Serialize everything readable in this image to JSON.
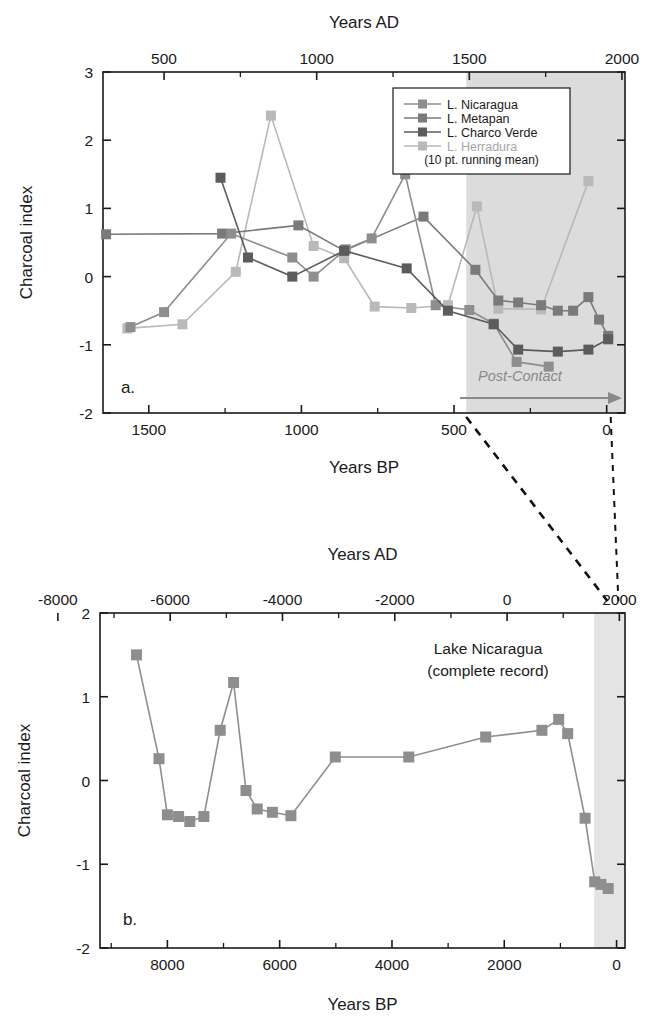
{
  "figure": {
    "background": "#ffffff",
    "shade_color": "#dcdcdc",
    "frame_color": "#1a1a1a"
  },
  "colors": {
    "nicaragua": "#8e8e8e",
    "metapan": "#7a7a7a",
    "charco_verde": "#5c5c5c",
    "herradura": "#b9b9b9",
    "post_contact": "#8a8a8a",
    "axis": "#1a1a1a"
  },
  "panel_a": {
    "letter": "a.",
    "top_axis_title": "Years AD",
    "bottom_axis_title": "Years BP",
    "y_axis_title": "Charcoal index",
    "top_ticks": [
      "500",
      "1000",
      "1500",
      "2000"
    ],
    "top_tick_values": [
      500,
      1000,
      1500,
      2000
    ],
    "bottom_ticks": [
      "1500",
      "1000",
      "500",
      "0"
    ],
    "bottom_tick_values": [
      1500,
      1000,
      500,
      0
    ],
    "y_ticks": [
      "3",
      "2",
      "1",
      "0",
      "-1",
      "-2"
    ],
    "y_tick_values": [
      3,
      2,
      1,
      0,
      -1,
      -2
    ],
    "annotation": "Post-Contact",
    "legend": {
      "note": "(10 pt. running mean)",
      "entries": [
        {
          "label": "L. Nicaragua",
          "color": "#8e8e8e"
        },
        {
          "label": "L. Metapan",
          "color": "#7a7a7a"
        },
        {
          "label": "L. Charco Verde",
          "color": "#5c5c5c"
        },
        {
          "label": "L. Herradura",
          "color": "#b9b9b9"
        }
      ]
    }
  },
  "panel_b": {
    "letter": "b.",
    "top_axis_title": "Years AD",
    "bottom_axis_title": "Years BP",
    "y_axis_title": "Charcoal index",
    "top_ticks": [
      "-8000",
      "-6000",
      "-4000",
      "-2000",
      "0",
      "2000"
    ],
    "top_tick_values": [
      -8000,
      -6000,
      -4000,
      -2000,
      0,
      2000
    ],
    "bottom_ticks": [
      "8000",
      "6000",
      "4000",
      "2000",
      "0"
    ],
    "bottom_tick_values": [
      8000,
      6000,
      4000,
      2000,
      0
    ],
    "y_ticks": [
      "2",
      "1",
      "0",
      "-1",
      "-2"
    ],
    "y_tick_values": [
      2,
      1,
      0,
      -1,
      -2
    ],
    "annotation_line1": "Lake Nicaragua",
    "annotation_line2": "(complete record)"
  },
  "chart_data": [
    {
      "type": "line",
      "panel": "a",
      "title": "",
      "xlabel": "Years BP",
      "ylabel": "Charcoal index",
      "xlim": [
        1650,
        -60
      ],
      "ylim": [
        -2,
        3
      ],
      "x_reversed": true,
      "grid": false,
      "legend_position": "top-right",
      "shaded_region": {
        "label": "Post-Contact",
        "x_from": 460,
        "x_to": -60
      },
      "series": [
        {
          "name": "L. Nicaragua",
          "color": "#8e8e8e",
          "points": [
            [
              1560,
              -0.74
            ],
            [
              1450,
              -0.52
            ],
            [
              1230,
              0.63
            ],
            [
              1030,
              0.28
            ],
            [
              960,
              0.0
            ],
            [
              855,
              0.4
            ],
            [
              770,
              0.56
            ],
            [
              660,
              1.5
            ],
            [
              560,
              -0.42
            ],
            [
              450,
              -0.49
            ],
            [
              370,
              -0.69
            ],
            [
              295,
              -1.25
            ],
            [
              190,
              -1.32
            ]
          ]
        },
        {
          "name": "L. Metapan",
          "color": "#7a7a7a",
          "points": [
            [
              1640,
              0.62
            ],
            [
              1260,
              0.63
            ],
            [
              1010,
              0.75
            ],
            [
              860,
              0.38
            ],
            [
              600,
              0.88
            ],
            [
              430,
              0.1
            ],
            [
              355,
              -0.35
            ],
            [
              290,
              -0.38
            ],
            [
              215,
              -0.42
            ],
            [
              160,
              -0.5
            ],
            [
              110,
              -0.5
            ],
            [
              60,
              -0.3
            ],
            [
              25,
              -0.63
            ],
            [
              -5,
              -0.87
            ]
          ]
        },
        {
          "name": "L. Charco Verde",
          "color": "#5c5c5c",
          "points": [
            [
              1265,
              1.45
            ],
            [
              1175,
              0.28
            ],
            [
              1030,
              0.0
            ],
            [
              860,
              0.38
            ],
            [
              655,
              0.12
            ],
            [
              520,
              -0.5
            ],
            [
              370,
              -0.7
            ],
            [
              290,
              -1.07
            ],
            [
              160,
              -1.1
            ],
            [
              60,
              -1.07
            ],
            [
              -5,
              -0.92
            ]
          ]
        },
        {
          "name": "L. Herradura",
          "color": "#b9b9b9",
          "points": [
            [
              1570,
              -0.76
            ],
            [
              1390,
              -0.7
            ],
            [
              1215,
              0.07
            ],
            [
              1100,
              2.36
            ],
            [
              960,
              0.45
            ],
            [
              860,
              0.27
            ],
            [
              760,
              -0.44
            ],
            [
              640,
              -0.46
            ],
            [
              520,
              -0.42
            ],
            [
              425,
              1.03
            ],
            [
              355,
              -0.47
            ],
            [
              215,
              -0.48
            ],
            [
              60,
              1.4
            ]
          ]
        }
      ]
    },
    {
      "type": "line",
      "panel": "b",
      "title": "Lake Nicaragua (complete record)",
      "xlabel": "Years BP",
      "ylabel": "Charcoal index",
      "xlim": [
        9200,
        -150
      ],
      "ylim": [
        -2,
        2
      ],
      "x_reversed": true,
      "grid": false,
      "shaded_region": {
        "label": "",
        "x_from": 400,
        "x_to": -150
      },
      "series": [
        {
          "name": "Lake Nicaragua",
          "color": "#8e8e8e",
          "points": [
            [
              8550,
              1.5
            ],
            [
              8150,
              0.26
            ],
            [
              8000,
              -0.41
            ],
            [
              7800,
              -0.43
            ],
            [
              7600,
              -0.49
            ],
            [
              7350,
              -0.43
            ],
            [
              7060,
              0.6
            ],
            [
              6820,
              1.17
            ],
            [
              6600,
              -0.12
            ],
            [
              6400,
              -0.34
            ],
            [
              6130,
              -0.38
            ],
            [
              5800,
              -0.42
            ],
            [
              5010,
              0.28
            ],
            [
              3700,
              0.28
            ],
            [
              2330,
              0.52
            ],
            [
              1330,
              0.6
            ],
            [
              1030,
              0.73
            ],
            [
              870,
              0.56
            ],
            [
              560,
              -0.45
            ],
            [
              390,
              -1.21
            ],
            [
              280,
              -1.24
            ],
            [
              150,
              -1.29
            ]
          ]
        }
      ]
    }
  ]
}
